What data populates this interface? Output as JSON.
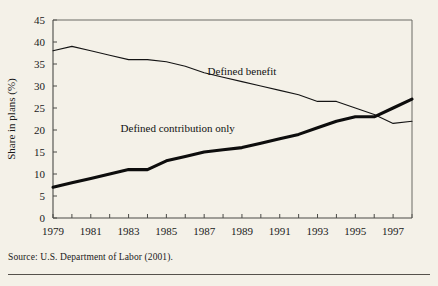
{
  "figure": {
    "source_note": "Source: U.S. Department of Labor (2001)."
  },
  "chart_data": {
    "type": "line",
    "title": "",
    "xlabel": "",
    "ylabel": "Share in plans (%)",
    "xlim": [
      1979,
      1998
    ],
    "ylim": [
      0,
      45
    ],
    "ytick_step": 5,
    "yticks": [
      "0",
      "5",
      "10",
      "15",
      "20",
      "25",
      "30",
      "35",
      "40",
      "45"
    ],
    "xticks_major": [
      "1979",
      "1981",
      "1983",
      "1985",
      "1987",
      "1989",
      "1991",
      "1993",
      "1995",
      "1997"
    ],
    "x": [
      1979,
      1980,
      1981,
      1982,
      1983,
      1984,
      1985,
      1986,
      1987,
      1988,
      1989,
      1990,
      1991,
      1992,
      1993,
      1994,
      1995,
      1996,
      1997,
      1998
    ],
    "grid": false,
    "legend_position": "inline-annotations",
    "annotations": [
      {
        "name": "defined-benefit-label",
        "text": "Defined benefit",
        "x": 1989.0,
        "y": 32.5
      },
      {
        "name": "defined-contribution-label",
        "text": "Defined contribution only",
        "x": 1985.6,
        "y": 19.5
      }
    ],
    "series": [
      {
        "name": "Defined benefit",
        "style": "thin",
        "values": [
          38,
          39,
          38,
          37,
          36,
          36,
          35.5,
          34.5,
          33,
          32,
          31,
          30,
          29,
          28,
          26.5,
          26.5,
          25,
          23.5,
          21.5,
          22
        ]
      },
      {
        "name": "Defined contribution only",
        "style": "thick",
        "values": [
          7,
          8,
          9,
          10,
          11,
          11,
          13,
          14,
          15,
          15.5,
          16,
          17,
          18,
          19,
          20.5,
          22,
          23,
          23,
          25,
          27
        ]
      }
    ]
  }
}
